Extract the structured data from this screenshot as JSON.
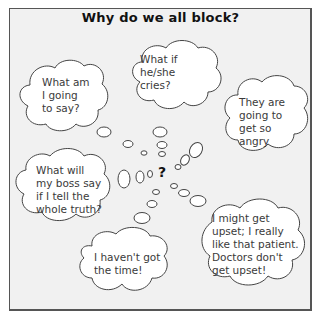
{
  "title": "Why do we all block?",
  "center_symbol": "?",
  "thoughts": [
    {
      "id": "what-am-i-going-to-say",
      "lines": [
        "What am",
        "I going",
        "to say?"
      ]
    },
    {
      "id": "what-if-he-she-cries",
      "lines": [
        "What if",
        "he/she",
        "cries?"
      ]
    },
    {
      "id": "they-are-going-to-get-so-angry",
      "lines": [
        "They are",
        "going to",
        "get so",
        "angry"
      ]
    },
    {
      "id": "what-will-my-boss-say",
      "lines": [
        "What will",
        "my boss say",
        "if I tell the",
        "whole truth?"
      ]
    },
    {
      "id": "i-havent-got-the-time",
      "lines": [
        "I haven't got",
        "the time!"
      ]
    },
    {
      "id": "i-might-get-upset",
      "lines": [
        "I might get",
        "upset; I really",
        "like that patient.",
        "Doctors don't",
        "get upset!"
      ]
    }
  ],
  "colors": {
    "background": "#f1f1f1",
    "frame_border": "#555555",
    "cloud_fill": "#ffffff",
    "cloud_stroke": "#444444",
    "text": "#3a3a3a"
  }
}
